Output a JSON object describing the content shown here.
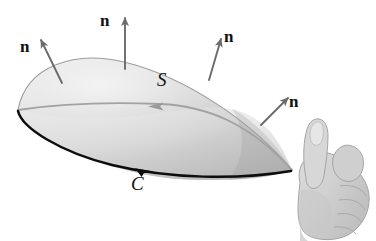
{
  "figure": {
    "background_color": "#ffffff"
  },
  "labels": {
    "normals": [
      {
        "text": "n",
        "name": "normal-label-left"
      },
      {
        "text": "n",
        "name": "normal-label-top"
      },
      {
        "text": "n",
        "name": "normal-label-upper-right"
      },
      {
        "text": "n",
        "name": "normal-label-right"
      }
    ],
    "surface": {
      "text": "S",
      "name": "surface-label"
    },
    "curve": {
      "text": "C",
      "name": "curve-label"
    }
  },
  "colors": {
    "surface_light": "#e6e6e6",
    "surface_mid": "#cccccc",
    "surface_dark": "#adadad",
    "boundary_curve": "#0d0d0d",
    "back_rim": "#a8a8a8",
    "normal_arrow": "#6b6b6b",
    "hand_fill": "#d2d2d2",
    "hand_shadow": "#b3b3b3",
    "hand_outline": "#9a9a9a",
    "label_text": "#111111"
  },
  "geometry": {
    "dome": {
      "left_tip": [
        18,
        110
      ],
      "apex": [
        122,
        62
      ],
      "right_tip": [
        292,
        170
      ]
    },
    "normal_arrows": [
      {
        "name": "normal-arrow-left",
        "from": [
          62,
          82
        ],
        "to": [
          38,
          36
        ]
      },
      {
        "name": "normal-arrow-top",
        "from": [
          124,
          68
        ],
        "to": [
          124,
          14
        ]
      },
      {
        "name": "normal-arrow-upper-right",
        "from": [
          210,
          80
        ],
        "to": [
          222,
          36
        ]
      },
      {
        "name": "normal-arrow-right",
        "from": [
          262,
          124
        ],
        "to": [
          290,
          96
        ]
      }
    ],
    "curve_direction_arrow_front": {
      "at": [
        148,
        166
      ],
      "direction": "right"
    },
    "curve_direction_arrow_back": {
      "at": [
        158,
        108
      ],
      "direction": "left"
    },
    "hand": {
      "bounds": [
        296,
        118,
        80,
        123
      ],
      "pose": "right-hand-thumbs-up"
    }
  }
}
